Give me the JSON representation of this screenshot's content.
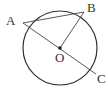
{
  "diagram": {
    "type": "circle-geometry",
    "circle": {
      "center": "O",
      "cx": 60,
      "cy": 48,
      "r": 37
    },
    "points": [
      {
        "name": "A",
        "x": 23,
        "y": 23,
        "label_x": 6,
        "label_y": 25
      },
      {
        "name": "B",
        "x": 84,
        "y": 12,
        "label_x": 87,
        "label_y": 12
      },
      {
        "name": "C",
        "x": 96,
        "y": 74,
        "label_x": 97,
        "label_y": 83
      },
      {
        "name": "O",
        "x": 60,
        "y": 48,
        "label_x": 55,
        "label_y": 62
      }
    ],
    "segments": [
      {
        "from": "A",
        "to": "B"
      },
      {
        "from": "A",
        "to": "C"
      },
      {
        "from": "O",
        "to": "B"
      }
    ],
    "labels": {
      "A": "A",
      "B": "B",
      "C": "C",
      "O": "O"
    },
    "colors": {
      "stroke": "#333333",
      "background": "#ffffff"
    }
  }
}
